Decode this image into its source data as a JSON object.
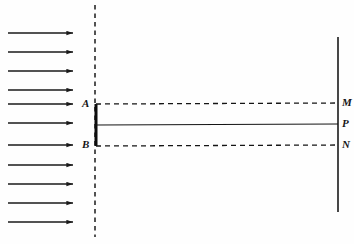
{
  "figure": {
    "type": "optics-diagram",
    "background_color": "#fefefe",
    "ink_color": "#151515",
    "width": 354,
    "height": 244
  },
  "incident_wavefront": {
    "name": "incident-plane-wave-arrows",
    "count": 11,
    "direction": "left-to-right",
    "x_start": 8,
    "x_end": 80,
    "y_positions": [
      33,
      52,
      71,
      90,
      104,
      123,
      145,
      165,
      184,
      203,
      222
    ],
    "color": "#1a1a1a"
  },
  "barrier": {
    "name": "barrier-axis-dashed-line",
    "x": 95,
    "y_top": 5,
    "y_bottom": 237,
    "style": "dashed",
    "color": "#1a1a1a"
  },
  "slit": {
    "name": "slit-aperture-bar",
    "x": 96,
    "y_top": 104,
    "y_bottom": 146,
    "style": "solid-thick",
    "color": "#0d0d0d",
    "labels": {
      "top": "A",
      "bottom": "B"
    }
  },
  "screen": {
    "name": "observation-screen-line",
    "x": 338,
    "y_top": 37,
    "y_bottom": 212,
    "style": "solid",
    "color": "#1a1a1a",
    "labels": {
      "upper": "M",
      "center": "P",
      "lower": "N"
    }
  },
  "rays": [
    {
      "name": "ray-A-to-M",
      "from": "A",
      "to": "M",
      "style": "dashed",
      "x1": 96,
      "y1": 104,
      "x2": 338,
      "y2": 103
    },
    {
      "name": "ray-center-to-P",
      "from": "slit-center",
      "to": "P",
      "style": "solid",
      "x1": 96,
      "y1": 125,
      "x2": 338,
      "y2": 124
    },
    {
      "name": "ray-B-to-N",
      "from": "B",
      "to": "N",
      "style": "dashed",
      "x1": 96,
      "y1": 146,
      "x2": 338,
      "y2": 145
    }
  ],
  "labels": {
    "A": {
      "text": "A",
      "x": 82,
      "y": 98
    },
    "B": {
      "text": "B",
      "x": 82,
      "y": 139
    },
    "M": {
      "text": "M",
      "x": 342,
      "y": 97
    },
    "P": {
      "text": "P",
      "x": 342,
      "y": 118
    },
    "N": {
      "text": "N",
      "x": 342,
      "y": 139
    }
  }
}
